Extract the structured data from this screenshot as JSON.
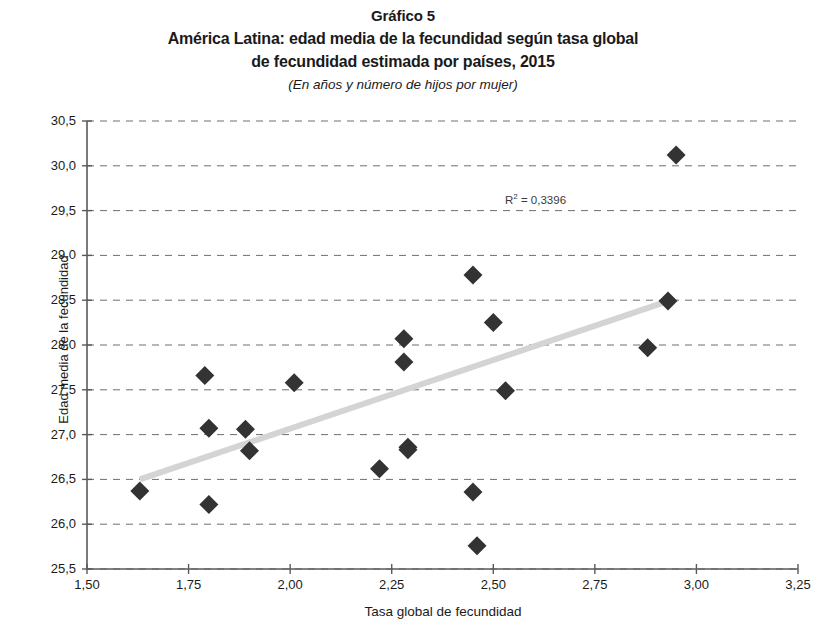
{
  "titles": {
    "figure_number": "Gráfico 5",
    "main_line1": "América Latina: edad media de la fecundidad según tasa global",
    "main_line2": "de fecundidad estimada por países, 2015",
    "subtitle": "(En años y número de hijos por mujer)"
  },
  "annotation": {
    "r2_prefix": "R",
    "r2_exponent": "2",
    "r2_value": " = 0,3396"
  },
  "chart_data": {
    "type": "scatter",
    "title": "América Latina: edad media de la fecundidad según tasa global de fecundidad estimada por países, 2015",
    "subtitle": "(En años y número de hijos por mujer)",
    "xlabel": "Tasa global de fecundidad",
    "ylabel": "Edad media de la fecundidad",
    "xlim": [
      1.5,
      3.25
    ],
    "ylim": [
      25.5,
      30.5
    ],
    "xticks": [
      1.5,
      1.75,
      2.0,
      2.25,
      2.5,
      2.75,
      3.0,
      3.25
    ],
    "yticks": [
      25.5,
      26.0,
      26.5,
      27.0,
      27.5,
      28.0,
      28.5,
      29.0,
      29.5,
      30.0,
      30.5
    ],
    "xtick_labels": [
      "1,50",
      "1,75",
      "2,00",
      "2,25",
      "2,50",
      "2,75",
      "3,00",
      "3,25"
    ],
    "ytick_labels": [
      "25,5",
      "26,0",
      "26,5",
      "27,0",
      "27,5",
      "28,0",
      "28,5",
      "29,0",
      "29,5",
      "30,0",
      "30,5"
    ],
    "grid": "horizontal-dashed",
    "legend": "none",
    "marker": "diamond",
    "marker_color": "#333333",
    "points": [
      {
        "x": 1.63,
        "y": 26.37
      },
      {
        "x": 1.79,
        "y": 27.66
      },
      {
        "x": 1.8,
        "y": 27.07
      },
      {
        "x": 1.8,
        "y": 26.22
      },
      {
        "x": 1.89,
        "y": 27.06
      },
      {
        "x": 1.9,
        "y": 26.82
      },
      {
        "x": 2.01,
        "y": 27.58
      },
      {
        "x": 2.22,
        "y": 26.62
      },
      {
        "x": 2.28,
        "y": 28.07
      },
      {
        "x": 2.28,
        "y": 27.81
      },
      {
        "x": 2.29,
        "y": 26.86
      },
      {
        "x": 2.29,
        "y": 26.83
      },
      {
        "x": 2.45,
        "y": 28.78
      },
      {
        "x": 2.45,
        "y": 26.36
      },
      {
        "x": 2.46,
        "y": 25.76
      },
      {
        "x": 2.5,
        "y": 28.25
      },
      {
        "x": 2.53,
        "y": 27.49
      },
      {
        "x": 2.88,
        "y": 27.97
      },
      {
        "x": 2.93,
        "y": 28.49
      },
      {
        "x": 2.95,
        "y": 30.12
      }
    ],
    "trendline": {
      "type": "linear",
      "x_start": 1.63,
      "y_start": 26.5,
      "x_end": 2.93,
      "y_end": 28.49,
      "color": "#d4d4d4",
      "r_squared": 0.3396,
      "r_squared_label": "R² = 0,3396"
    }
  }
}
